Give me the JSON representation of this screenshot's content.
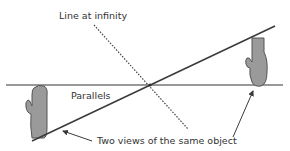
{
  "diagram": {
    "labels": {
      "line_at_infinity": "Line at infinity",
      "parallels": "Parallels",
      "two_views": "Two views of the same object"
    },
    "colors": {
      "line": "#3a3a3a",
      "horizon": "#777777",
      "object_fill": "#9a9a9a",
      "object_stroke": "#555555",
      "text": "#333333"
    },
    "elements": {
      "horizontal_line": {
        "x1": 6,
        "y1": 85,
        "x2": 283,
        "y2": 85
      },
      "diagonal_line": {
        "x1": 32,
        "y1": 141,
        "x2": 275,
        "y2": 26
      },
      "dotted_line": {
        "x1": 94,
        "y1": 25,
        "x2": 188,
        "y2": 129
      },
      "intersection": {
        "x": 150,
        "y": 85
      },
      "object_left": {
        "x": 28,
        "y": 85,
        "w": 21,
        "h": 53
      },
      "object_right": {
        "x": 249,
        "y": 38,
        "w": 19,
        "h": 48
      },
      "arrow_left": {
        "from": [
          92,
          141
        ],
        "to": [
          62,
          131
        ]
      },
      "arrow_right": {
        "from": [
          233,
          137
        ],
        "to": [
          254,
          89
        ]
      }
    }
  }
}
